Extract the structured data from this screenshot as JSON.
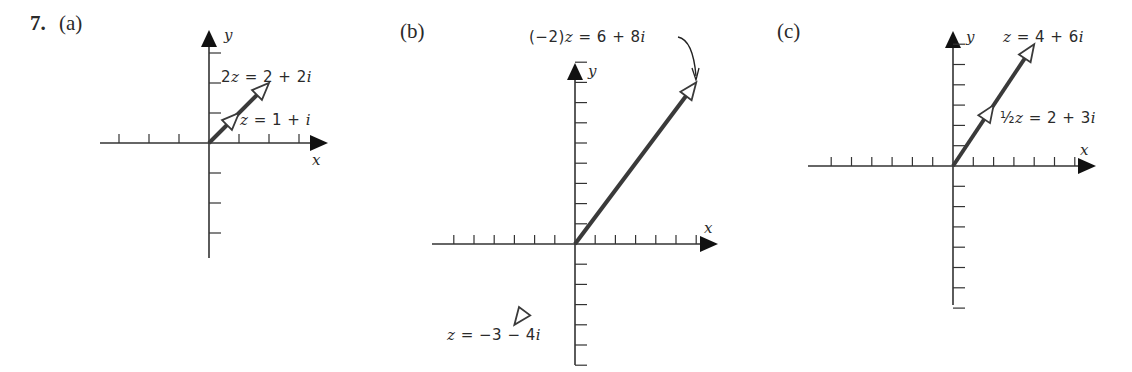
{
  "problem": {
    "number": "7.",
    "panels": [
      {
        "id": "a",
        "label": "(a)",
        "origin_px": [
          209,
          143
        ],
        "unit_px": 30,
        "x_ticks": [
          -3,
          -2,
          -1,
          1,
          2,
          3
        ],
        "y_ticks": [
          -3,
          -2,
          -1,
          1,
          2,
          3
        ],
        "x_range_px": [
          100,
          328
        ],
        "y_range_px": [
          258,
          30
        ],
        "axis_labels": {
          "x": "x",
          "y": "y"
        },
        "vectors": [
          {
            "name": "2z",
            "tip": [
              2,
              2
            ],
            "label": "2z = 2 + 2i",
            "label_parts": [
              "2",
              "z",
              " = 2 + 2",
              "i"
            ]
          },
          {
            "name": "z",
            "tip": [
              1,
              1
            ],
            "label": "z = 1 + i",
            "label_parts": [
              "",
              "z",
              " = 1 + ",
              "i"
            ]
          }
        ]
      },
      {
        "id": "b",
        "label": "(b)",
        "origin_px": [
          575,
          244
        ],
        "unit_px": 20.2,
        "x_ticks": [
          -6,
          -5,
          -4,
          -3,
          -2,
          -1,
          1,
          2,
          3,
          4,
          5,
          6
        ],
        "y_ticks": [
          -6,
          -5,
          -4,
          -3,
          -2,
          -1,
          1,
          2,
          3,
          4,
          5,
          6,
          7,
          8,
          9
        ],
        "x_range_px": [
          432,
          718
        ],
        "y_range_px": [
          365,
          63
        ],
        "axis_labels": {
          "x": "x",
          "y": "y"
        },
        "vectors": [
          {
            "name": "(-2)z",
            "tip": [
              6,
              8
            ],
            "label": "(−2)z = 6 + 8i",
            "label_parts": [
              "(−2)",
              "z",
              " = 6 + 8",
              "i"
            ]
          },
          {
            "name": "z",
            "tip": [
              -3,
              -4
            ],
            "label": "z = −3 − 4i",
            "label_parts": [
              "",
              "z",
              " = −3 − 4",
              "i"
            ]
          }
        ]
      },
      {
        "id": "c",
        "label": "(c)",
        "origin_px": [
          953,
          166
        ],
        "unit_px": 20.3,
        "x_ticks": [
          -6,
          -5,
          -4,
          -3,
          -2,
          -1,
          1,
          2,
          3,
          4,
          5,
          6
        ],
        "y_ticks": [
          -7,
          -6,
          -5,
          -4,
          -3,
          -2,
          -1,
          1,
          2,
          3,
          4,
          5,
          6
        ],
        "x_range_px": [
          808,
          1096
        ],
        "y_range_px": [
          305,
          31
        ],
        "axis_labels": {
          "x": "x",
          "y": "y"
        },
        "vectors": [
          {
            "name": "z",
            "tip": [
              4,
              6
            ],
            "label": "z = 4 + 6i",
            "label_parts": [
              "",
              "z",
              " = 4 + 6",
              "i"
            ]
          },
          {
            "name": "(1/2)z",
            "tip": [
              2,
              3
            ],
            "label": "½z = 2 + 3i",
            "label_parts": [
              "½",
              "z",
              " = 2 + 3",
              "i"
            ]
          }
        ]
      }
    ]
  },
  "colors": {
    "axis": "#333333",
    "vector": "#3a3a3a",
    "text": "#2a2a2a",
    "background": "#ffffff"
  }
}
